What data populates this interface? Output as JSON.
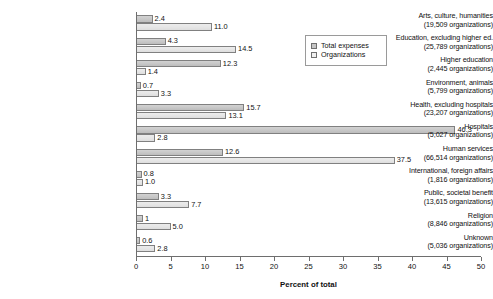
{
  "chart_data": {
    "type": "bar",
    "orientation": "horizontal",
    "title": "",
    "xlabel": "Percent of total",
    "ylabel": "",
    "xlim": [
      0,
      50
    ],
    "xticks": [
      0,
      5,
      10,
      15,
      20,
      25,
      30,
      35,
      40,
      45,
      50
    ],
    "grid": false,
    "legend_position": "top-right",
    "categories": [
      "Arts, culture, humanities",
      "Education, excluding higher ed.",
      "Higher education",
      "Environment, animals",
      "Health, excluding hospitals",
      "Hospitals",
      "Human services",
      "International, foreign affairs",
      "Public, societal benefit",
      "Religion",
      "Unknown"
    ],
    "category_sublabels": [
      "(19,509 organizations)",
      "(25,789 organizations)",
      "(2,445 organizations)",
      "(5,799 organizations)",
      "(23,207 organizations)",
      "(5,027 organizations)",
      "(66,514 organizations)",
      "(1,816 organizations)",
      "(13,615 organizations)",
      "(8,846 organizations)",
      "(5,036 organizations)"
    ],
    "series": [
      {
        "name": "Total expenses",
        "color": "#c8c8c8",
        "values": [
          2.4,
          4.3,
          12.3,
          0.7,
          15.7,
          46.3,
          12.6,
          0.8,
          3.3,
          1.0,
          0.6
        ],
        "labels": [
          "2.4",
          "4.3",
          "12.3",
          "0.7",
          "15.7",
          "46.3",
          "12.6",
          "0.8",
          "3.3",
          "1",
          "0.6"
        ]
      },
      {
        "name": "Organizations",
        "color": "#e8e8e8",
        "values": [
          11.0,
          14.5,
          1.4,
          3.3,
          13.1,
          2.8,
          37.5,
          1.0,
          7.7,
          5.0,
          2.8
        ],
        "labels": [
          "11.0",
          "14.5",
          "1.4",
          "3.3",
          "13.1",
          "2.8",
          "37.5",
          "1.0",
          "7.7",
          "5.0",
          "2.8"
        ]
      }
    ]
  },
  "legend": {
    "items": [
      {
        "label": "Total expenses"
      },
      {
        "label": "Organizations"
      }
    ]
  },
  "axis": {
    "x_title": "Percent of total",
    "tick_labels": [
      "0",
      "5",
      "10",
      "15",
      "20",
      "25",
      "30",
      "35",
      "40",
      "45",
      "50"
    ]
  }
}
